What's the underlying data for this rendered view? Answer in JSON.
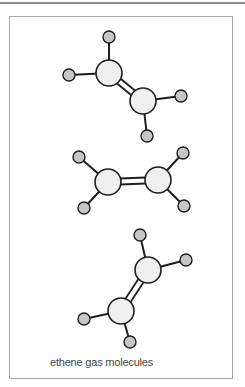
{
  "caption": "ethene gas molecules",
  "colors": {
    "bond": "#1e1e1e",
    "carbon_fill": "#efefef",
    "hydrogen_fill": "#c6c6c6",
    "outline": "#1e1e1e",
    "frame": "#a8a8a8"
  },
  "molecules": [
    {
      "name": "ethene-1",
      "carbons": [
        [
          109,
          73
        ],
        [
          143,
          101
        ]
      ],
      "hydrogens": [
        {
          "pos": [
            109,
            37
          ],
          "bonded_to": 0
        },
        {
          "pos": [
            69,
            75
          ],
          "bonded_to": 0
        },
        {
          "pos": [
            181,
            96
          ],
          "bonded_to": 1
        },
        {
          "pos": [
            147,
            136
          ],
          "bonded_to": 1
        }
      ]
    },
    {
      "name": "ethene-2",
      "carbons": [
        [
          108,
          182
        ],
        [
          158,
          180
        ]
      ],
      "hydrogens": [
        {
          "pos": [
            79,
            157
          ],
          "bonded_to": 0
        },
        {
          "pos": [
            84,
            208
          ],
          "bonded_to": 0
        },
        {
          "pos": [
            183,
            153
          ],
          "bonded_to": 1
        },
        {
          "pos": [
            184,
            206
          ],
          "bonded_to": 1
        }
      ]
    },
    {
      "name": "ethene-3",
      "carbons": [
        [
          148,
          270
        ],
        [
          121,
          311
        ]
      ],
      "hydrogens": [
        {
          "pos": [
            140,
            235
          ],
          "bonded_to": 0
        },
        {
          "pos": [
            186,
            260
          ],
          "bonded_to": 0
        },
        {
          "pos": [
            84,
            319
          ],
          "bonded_to": 1
        },
        {
          "pos": [
            130,
            342
          ],
          "bonded_to": 1
        }
      ]
    }
  ],
  "atom_radius": {
    "carbon": 13,
    "hydrogen": 6
  }
}
